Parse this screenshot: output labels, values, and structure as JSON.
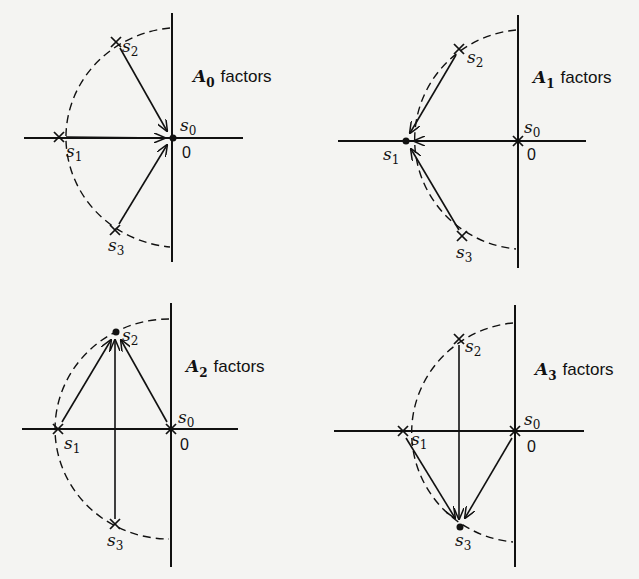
{
  "panels": [
    {
      "id": "A0",
      "title_letter": "A",
      "title_sub": "0",
      "title_word": "factors",
      "origin_label": "0",
      "evaluated_at": "s0",
      "points": {
        "s0": "dot",
        "s1": "cross",
        "s2": "cross",
        "s3": "cross"
      },
      "arrows": [
        [
          "s1",
          "s0"
        ],
        [
          "s2",
          "s0"
        ],
        [
          "s3",
          "s0"
        ]
      ]
    },
    {
      "id": "A1",
      "title_letter": "A",
      "title_sub": "1",
      "title_word": "factors",
      "origin_label": "0",
      "evaluated_at": "s1",
      "points": {
        "s0": "cross",
        "s1": "dot",
        "s2": "cross",
        "s3": "cross"
      },
      "arrows": [
        [
          "s0",
          "s1"
        ],
        [
          "s2",
          "s1"
        ],
        [
          "s3",
          "s1"
        ]
      ]
    },
    {
      "id": "A2",
      "title_letter": "A",
      "title_sub": "2",
      "title_word": "factors",
      "origin_label": "0",
      "evaluated_at": "s2",
      "points": {
        "s0": "cross",
        "s1": "cross",
        "s2": "dot",
        "s3": "cross"
      },
      "arrows": [
        [
          "s0",
          "s2"
        ],
        [
          "s1",
          "s2"
        ],
        [
          "s3",
          "s2"
        ]
      ]
    },
    {
      "id": "A3",
      "title_letter": "A",
      "title_sub": "3",
      "title_word": "factors",
      "origin_label": "0",
      "evaluated_at": "s3",
      "points": {
        "s0": "cross",
        "s1": "cross",
        "s2": "cross",
        "s3": "dot"
      },
      "arrows": [
        [
          "s0",
          "s3"
        ],
        [
          "s1",
          "s3"
        ],
        [
          "s2",
          "s3"
        ]
      ]
    }
  ],
  "labels": {
    "s": "s",
    "sub0": "0",
    "sub1": "1",
    "sub2": "2",
    "sub3": "3"
  }
}
